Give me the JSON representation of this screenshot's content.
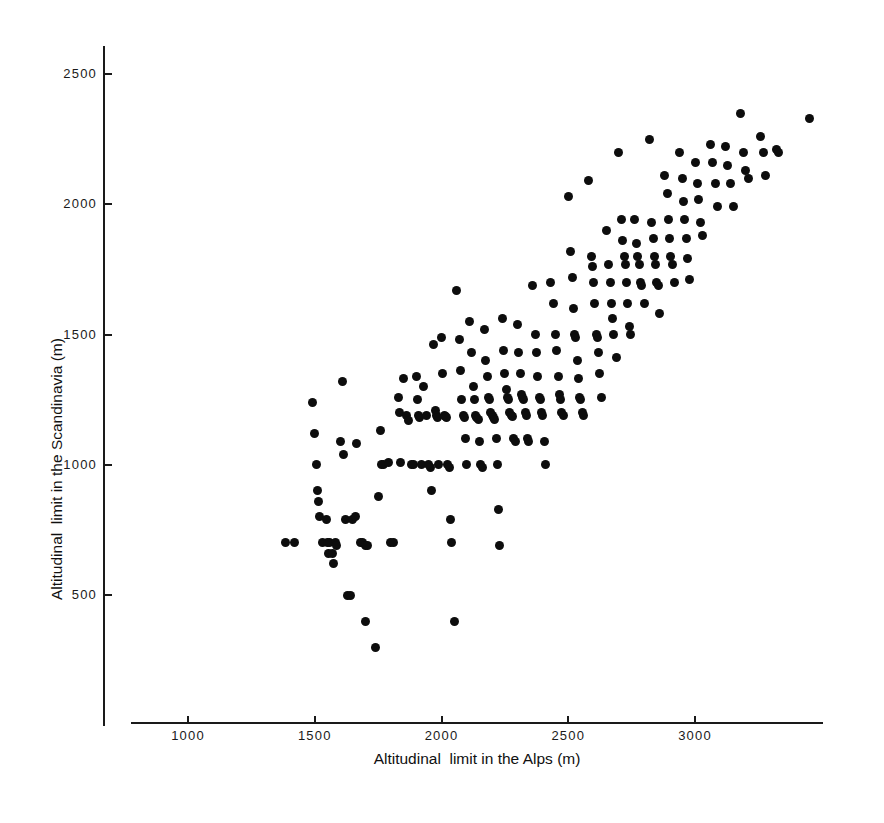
{
  "chart_data": {
    "type": "scatter",
    "title": "",
    "xlabel": "Altitudinal  limit in the Alps (m)",
    "ylabel": "Altitudinal  limit in the Scandinavia (m)",
    "xlim": [
      830,
      3560
    ],
    "ylim": [
      180,
      2620
    ],
    "xticks": [
      1000,
      1500,
      2000,
      2500,
      3000
    ],
    "yticks": [
      500,
      1000,
      1500,
      2000,
      2500
    ],
    "xticklabels": [
      "1000",
      "1500",
      "2000",
      "2500",
      "3000"
    ],
    "yticklabels": [
      "500",
      "1000",
      "1500",
      "2000",
      "2500"
    ],
    "grid": false,
    "legend": null,
    "marker": "filled-circle",
    "marker_color": "#0d0d0d",
    "marker_size_px": 9,
    "n_points": 232,
    "points": [
      [
        1385,
        700
      ],
      [
        1420,
        700
      ],
      [
        1490,
        1240
      ],
      [
        1500,
        1120
      ],
      [
        1505,
        1000
      ],
      [
        1510,
        900
      ],
      [
        1515,
        860
      ],
      [
        1520,
        800
      ],
      [
        1530,
        700
      ],
      [
        1545,
        790
      ],
      [
        1550,
        700
      ],
      [
        1555,
        660
      ],
      [
        1560,
        700
      ],
      [
        1570,
        660
      ],
      [
        1575,
        620
      ],
      [
        1580,
        700
      ],
      [
        1585,
        690
      ],
      [
        1600,
        1090
      ],
      [
        1610,
        1320
      ],
      [
        1615,
        1040
      ],
      [
        1620,
        790
      ],
      [
        1630,
        500
      ],
      [
        1640,
        500
      ],
      [
        1650,
        790
      ],
      [
        1660,
        800
      ],
      [
        1665,
        1080
      ],
      [
        1680,
        700
      ],
      [
        1690,
        700
      ],
      [
        1700,
        690
      ],
      [
        1710,
        690
      ],
      [
        1700,
        400
      ],
      [
        1740,
        300
      ],
      [
        1750,
        880
      ],
      [
        1760,
        1130
      ],
      [
        1765,
        1000
      ],
      [
        1770,
        1000
      ],
      [
        1790,
        1010
      ],
      [
        1800,
        700
      ],
      [
        1810,
        700
      ],
      [
        1830,
        1260
      ],
      [
        1835,
        1200
      ],
      [
        1840,
        1010
      ],
      [
        1850,
        1330
      ],
      [
        1860,
        1190
      ],
      [
        1870,
        1170
      ],
      [
        1880,
        1000
      ],
      [
        1890,
        1000
      ],
      [
        1900,
        1340
      ],
      [
        1905,
        1250
      ],
      [
        1910,
        1190
      ],
      [
        1915,
        1180
      ],
      [
        1920,
        1000
      ],
      [
        1930,
        1300
      ],
      [
        1940,
        1190
      ],
      [
        1950,
        1000
      ],
      [
        1955,
        990
      ],
      [
        1960,
        900
      ],
      [
        1970,
        1460
      ],
      [
        1975,
        1210
      ],
      [
        1980,
        1190
      ],
      [
        1985,
        1180
      ],
      [
        1990,
        1000
      ],
      [
        2000,
        1490
      ],
      [
        2005,
        1350
      ],
      [
        2010,
        1190
      ],
      [
        2015,
        1185
      ],
      [
        2020,
        1180
      ],
      [
        2025,
        1000
      ],
      [
        2030,
        990
      ],
      [
        2035,
        790
      ],
      [
        2040,
        700
      ],
      [
        2050,
        400
      ],
      [
        2060,
        1670
      ],
      [
        2070,
        1480
      ],
      [
        2075,
        1360
      ],
      [
        2080,
        1250
      ],
      [
        2085,
        1190
      ],
      [
        2090,
        1180
      ],
      [
        2095,
        1100
      ],
      [
        2100,
        1000
      ],
      [
        2110,
        1550
      ],
      [
        2120,
        1430
      ],
      [
        2125,
        1300
      ],
      [
        2130,
        1250
      ],
      [
        2135,
        1190
      ],
      [
        2140,
        1180
      ],
      [
        2145,
        1175
      ],
      [
        2150,
        1090
      ],
      [
        2155,
        1000
      ],
      [
        2160,
        990
      ],
      [
        2170,
        1520
      ],
      [
        2175,
        1400
      ],
      [
        2180,
        1340
      ],
      [
        2185,
        1260
      ],
      [
        2190,
        1250
      ],
      [
        2195,
        1200
      ],
      [
        2200,
        1190
      ],
      [
        2205,
        1180
      ],
      [
        2210,
        1175
      ],
      [
        2215,
        1100
      ],
      [
        2220,
        1000
      ],
      [
        2225,
        830
      ],
      [
        2230,
        690
      ],
      [
        2240,
        1560
      ],
      [
        2245,
        1440
      ],
      [
        2250,
        1350
      ],
      [
        2255,
        1290
      ],
      [
        2260,
        1260
      ],
      [
        2265,
        1250
      ],
      [
        2270,
        1200
      ],
      [
        2275,
        1190
      ],
      [
        2280,
        1185
      ],
      [
        2285,
        1100
      ],
      [
        2290,
        1090
      ],
      [
        2300,
        1540
      ],
      [
        2305,
        1430
      ],
      [
        2310,
        1350
      ],
      [
        2315,
        1270
      ],
      [
        2320,
        1260
      ],
      [
        2325,
        1250
      ],
      [
        2330,
        1200
      ],
      [
        2335,
        1190
      ],
      [
        2340,
        1100
      ],
      [
        2345,
        1090
      ],
      [
        2360,
        1690
      ],
      [
        2370,
        1500
      ],
      [
        2375,
        1430
      ],
      [
        2380,
        1340
      ],
      [
        2385,
        1260
      ],
      [
        2390,
        1250
      ],
      [
        2395,
        1200
      ],
      [
        2400,
        1190
      ],
      [
        2405,
        1090
      ],
      [
        2410,
        1000
      ],
      [
        2430,
        1700
      ],
      [
        2440,
        1620
      ],
      [
        2450,
        1500
      ],
      [
        2455,
        1440
      ],
      [
        2460,
        1340
      ],
      [
        2465,
        1270
      ],
      [
        2470,
        1250
      ],
      [
        2475,
        1200
      ],
      [
        2480,
        1190
      ],
      [
        2500,
        2030
      ],
      [
        2510,
        1820
      ],
      [
        2515,
        1720
      ],
      [
        2520,
        1600
      ],
      [
        2525,
        1500
      ],
      [
        2530,
        1490
      ],
      [
        2535,
        1400
      ],
      [
        2540,
        1330
      ],
      [
        2545,
        1260
      ],
      [
        2550,
        1250
      ],
      [
        2555,
        1200
      ],
      [
        2560,
        1190
      ],
      [
        2580,
        2090
      ],
      [
        2590,
        1800
      ],
      [
        2595,
        1760
      ],
      [
        2600,
        1700
      ],
      [
        2605,
        1620
      ],
      [
        2610,
        1500
      ],
      [
        2615,
        1490
      ],
      [
        2620,
        1430
      ],
      [
        2625,
        1350
      ],
      [
        2630,
        1260
      ],
      [
        2650,
        1900
      ],
      [
        2660,
        1770
      ],
      [
        2665,
        1700
      ],
      [
        2670,
        1620
      ],
      [
        2675,
        1560
      ],
      [
        2680,
        1500
      ],
      [
        2690,
        1410
      ],
      [
        2700,
        2200
      ],
      [
        2710,
        1940
      ],
      [
        2715,
        1860
      ],
      [
        2720,
        1800
      ],
      [
        2725,
        1770
      ],
      [
        2730,
        1700
      ],
      [
        2735,
        1620
      ],
      [
        2740,
        1530
      ],
      [
        2745,
        1500
      ],
      [
        2760,
        1940
      ],
      [
        2770,
        1850
      ],
      [
        2775,
        1800
      ],
      [
        2780,
        1770
      ],
      [
        2785,
        1700
      ],
      [
        2790,
        1690
      ],
      [
        2800,
        1620
      ],
      [
        2820,
        2250
      ],
      [
        2830,
        1930
      ],
      [
        2835,
        1870
      ],
      [
        2840,
        1800
      ],
      [
        2845,
        1770
      ],
      [
        2850,
        1700
      ],
      [
        2855,
        1690
      ],
      [
        2860,
        1580
      ],
      [
        2880,
        2110
      ],
      [
        2890,
        2040
      ],
      [
        2895,
        1940
      ],
      [
        2900,
        1870
      ],
      [
        2905,
        1800
      ],
      [
        2910,
        1770
      ],
      [
        2920,
        1700
      ],
      [
        2940,
        2200
      ],
      [
        2950,
        2100
      ],
      [
        2955,
        2010
      ],
      [
        2960,
        1940
      ],
      [
        2965,
        1870
      ],
      [
        2970,
        1790
      ],
      [
        2980,
        1710
      ],
      [
        3000,
        2160
      ],
      [
        3010,
        2080
      ],
      [
        3015,
        2020
      ],
      [
        3020,
        1930
      ],
      [
        3030,
        1880
      ],
      [
        3060,
        2230
      ],
      [
        3070,
        2160
      ],
      [
        3080,
        2080
      ],
      [
        3090,
        1990
      ],
      [
        3120,
        2220
      ],
      [
        3130,
        2150
      ],
      [
        3140,
        2080
      ],
      [
        3150,
        1990
      ],
      [
        3180,
        2350
      ],
      [
        3190,
        2200
      ],
      [
        3200,
        2130
      ],
      [
        3210,
        2100
      ],
      [
        3260,
        2260
      ],
      [
        3270,
        2200
      ],
      [
        3280,
        2110
      ],
      [
        3320,
        2210
      ],
      [
        3330,
        2200
      ],
      [
        3450,
        2330
      ]
    ]
  },
  "axes": {
    "x_pixel_origin": 188,
    "x_pixel_per_unit": 0.2535,
    "y_pixel_origin": 74,
    "y_pixel_per_unit": 0.2605
  }
}
